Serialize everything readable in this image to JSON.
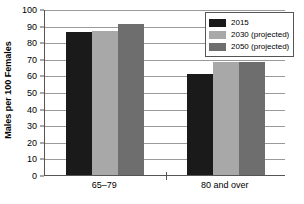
{
  "chart_data": {
    "type": "bar",
    "title": "",
    "xlabel": "",
    "ylabel": "Males per 100 Females",
    "categories": [
      "65–79",
      "80 and over"
    ],
    "ylim": [
      0,
      100
    ],
    "ytick_step": 10,
    "yticks": [
      "100",
      "90",
      "80",
      "70",
      "60",
      "50",
      "40",
      "30",
      "20",
      "10",
      "0"
    ],
    "grid": true,
    "legend_position": "top-right",
    "series": [
      {
        "name": "2015",
        "color": "#1a1a1a",
        "values": [
          86,
          61
        ]
      },
      {
        "name": "2030 (projected)",
        "color": "#a8a8a8",
        "values": [
          87,
          68
        ]
      },
      {
        "name": "2050 (projected)",
        "color": "#6e6e6e",
        "values": [
          91,
          68
        ]
      }
    ]
  },
  "legend": {
    "items": [
      {
        "label": "2015",
        "color": "#1a1a1a"
      },
      {
        "label": "2030 (projected)",
        "color": "#a8a8a8"
      },
      {
        "label": "2050 (projected)",
        "color": "#6e6e6e"
      }
    ]
  },
  "axis": {
    "y_title": "Males per 100 Females"
  }
}
